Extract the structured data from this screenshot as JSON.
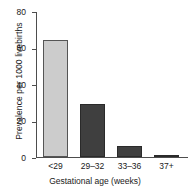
{
  "chart_data": {
    "type": "bar",
    "title": "",
    "categories": [
      "<29",
      "29–32",
      "33–36",
      "37+"
    ],
    "values": [
      64,
      29,
      6,
      1
    ],
    "xlabel": "Gestational age (weeks)",
    "ylabel": "Prevalence per 1000 livebirths",
    "ylim": [
      0,
      80
    ],
    "yticks": [
      0,
      20,
      40,
      60,
      80
    ],
    "ytick_labels": [
      "0",
      "20",
      "40",
      "60",
      "80"
    ],
    "grid": false,
    "legend": null,
    "bar_colors": [
      "#cccccc",
      "#3f3f3f",
      "#3f3f3f",
      "#3f3f3f"
    ],
    "bar_edge_colors": [
      "#555555",
      "#2a2a2a",
      "#2a2a2a",
      "#2a2a2a"
    ]
  }
}
